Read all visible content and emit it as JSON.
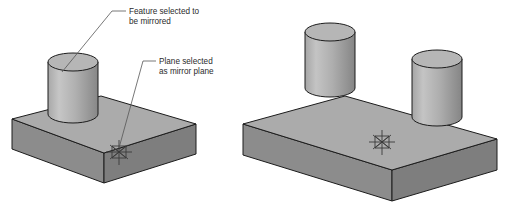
{
  "figure": {
    "background_color": "#ffffff",
    "annotations": [
      {
        "id": "feature-annotation",
        "line1": "Feature selected to",
        "line2": "be mirrored",
        "text_x": 129,
        "text_y": 14,
        "leader": "M126,11 L112,11 L62,72",
        "target": "cylinder on left block"
      },
      {
        "id": "plane-annotation",
        "line1": "Plane selected",
        "line2": "as mirror plane",
        "text_x": 159,
        "text_y": 64,
        "leader": "M156,61 L143,61 L119,148",
        "target": "mirror plane symbol on left block"
      }
    ],
    "models": [
      {
        "id": "model-before",
        "label": "before mirror",
        "cylinder_count": 1,
        "has_mirror_plane_symbol": true,
        "block": {
          "top_left": [
            12,
            119
          ],
          "top_back": [
            101,
            96
          ],
          "top_right": [
            196,
            124
          ],
          "top_front": [
            104,
            153
          ],
          "depth": 30
        },
        "cylinders": [
          {
            "cx": 73,
            "top_y": 58,
            "rx": 25,
            "ry": 9,
            "height": 62
          }
        ],
        "plane_symbol": {
          "cx": 119,
          "cy": 152,
          "size": 13
        }
      },
      {
        "id": "model-after",
        "label": "after mirror",
        "cylinder_count": 2,
        "has_mirror_plane_symbol": true,
        "block": {
          "top_left": [
            243,
            124
          ],
          "top_back": [
            345,
            96
          ],
          "top_right": [
            497,
            139
          ],
          "top_front": [
            392,
            170
          ],
          "depth": 31
        },
        "cylinders": [
          {
            "cx": 330,
            "top_y": 28,
            "rx": 25,
            "ry": 9,
            "height": 68
          },
          {
            "cx": 437,
            "top_y": 55,
            "rx": 25,
            "ry": 9,
            "height": 68
          }
        ],
        "plane_symbol": {
          "cx": 382,
          "cy": 142,
          "size": 13
        }
      }
    ],
    "colors": {
      "top_face": "#ababab",
      "front_face": "#8c8c8c",
      "side_face": "#7e7e7e",
      "cylinder_light": "#c2c2c2",
      "cylinder_dark": "#8a8a8a",
      "cylinder_top": "#b4b4b4",
      "outline": "#1c1c1c",
      "leader_line": "#555555",
      "text": "#2b2b2b",
      "symbol": "#3a3a3a"
    }
  }
}
